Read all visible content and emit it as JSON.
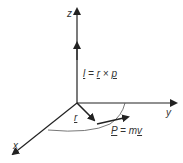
{
  "diagram": {
    "axes": {
      "x": "x",
      "y": "y",
      "z": "z"
    },
    "labels": {
      "angular_momentum": {
        "l": "l",
        "eq": " = ",
        "r": "r",
        "times": " × ",
        "p": "p"
      },
      "position": "r",
      "momentum": {
        "P": "P",
        "eq": " = ",
        "m": "m",
        "v": "v"
      }
    },
    "colors": {
      "line": "#222222",
      "background": "#ffffff"
    }
  }
}
